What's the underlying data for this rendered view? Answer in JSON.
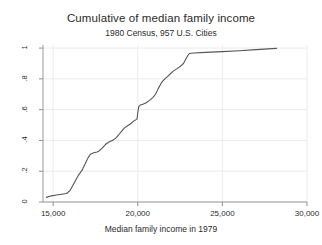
{
  "chart_data": {
    "type": "line",
    "title": "Cumulative of median family income",
    "subtitle": "1980 Census, 957 U.S. Cities",
    "xlabel": "Median family income in 1979",
    "ylabel": "",
    "xlim": [
      14400,
      30000
    ],
    "ylim": [
      0,
      1.02
    ],
    "grid": true,
    "legend": "none",
    "xticks": [
      15000,
      20000,
      25000,
      30000
    ],
    "xtick_labels": [
      "15,000",
      "20,000",
      "25,000",
      "30,000"
    ],
    "yticks": [
      0,
      0.2,
      0.4,
      0.6,
      0.8,
      1
    ],
    "ytick_labels": [
      "0",
      ".2",
      ".4",
      ".6",
      ".8",
      "1"
    ],
    "line_color": "#555555",
    "series": [
      {
        "name": "Cumulative proportion",
        "x": [
          14600,
          14900,
          15200,
          15500,
          15800,
          16000,
          16150,
          16300,
          16500,
          16700,
          16900,
          17050,
          17200,
          17400,
          17600,
          17750,
          17900,
          18100,
          18300,
          18500,
          18700,
          18900,
          19050,
          19200,
          19400,
          19600,
          19750,
          19900,
          19960,
          20000,
          20060,
          20150,
          20300,
          20500,
          20700,
          20900,
          21050,
          21200,
          21400,
          21600,
          21750,
          21900,
          22100,
          22300,
          22500,
          22700,
          22850,
          22950,
          23050,
          23300,
          24000,
          25000,
          26000,
          27000,
          28200
        ],
        "y": [
          0.03,
          0.04,
          0.045,
          0.05,
          0.055,
          0.075,
          0.105,
          0.135,
          0.175,
          0.205,
          0.25,
          0.285,
          0.31,
          0.32,
          0.325,
          0.335,
          0.35,
          0.375,
          0.39,
          0.4,
          0.415,
          0.44,
          0.46,
          0.48,
          0.495,
          0.51,
          0.525,
          0.535,
          0.54,
          0.58,
          0.62,
          0.63,
          0.635,
          0.645,
          0.66,
          0.68,
          0.7,
          0.735,
          0.775,
          0.8,
          0.815,
          0.83,
          0.85,
          0.865,
          0.88,
          0.9,
          0.93,
          0.95,
          0.965,
          0.968,
          0.972,
          0.977,
          0.983,
          0.99,
          0.998
        ]
      }
    ]
  }
}
